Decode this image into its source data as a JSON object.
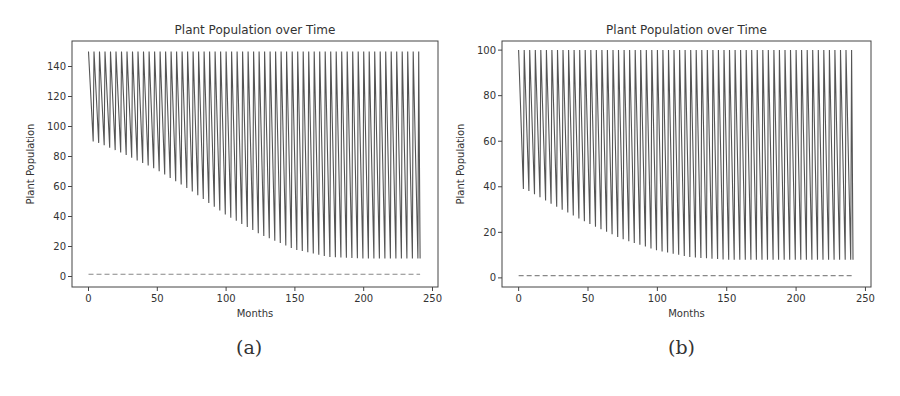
{
  "figure": {
    "captions": [
      "(a)",
      "(b)"
    ]
  },
  "chart_data": [
    {
      "type": "line",
      "panel_label": "(a)",
      "title": "Plant Population over Time",
      "xlabel": "Months",
      "ylabel": "Plant Population",
      "xlim": [
        -12,
        254
      ],
      "ylim": [
        -7,
        157
      ],
      "xticks": [
        0,
        50,
        100,
        150,
        200,
        250
      ],
      "yticks": [
        0,
        20,
        40,
        60,
        80,
        100,
        120,
        140
      ],
      "grid": false,
      "legend": null,
      "series": [
        {
          "name": "plant population",
          "style": "solid",
          "color": "#555555",
          "pattern": "sawtooth",
          "period_months": 4,
          "x_range": [
            0,
            241
          ],
          "peak_value": 150,
          "trough_envelope": {
            "x": [
              5,
              25,
              50,
              75,
              100,
              125,
              150,
              175,
              200,
              241
            ],
            "y": [
              90,
              82,
              71,
              57,
              41,
              28,
              18,
              13,
              12,
              12
            ]
          }
        },
        {
          "name": "threshold",
          "style": "dashed",
          "color": "#888888",
          "x": [
            0,
            241
          ],
          "y": [
            1.5,
            1.5
          ]
        }
      ]
    },
    {
      "type": "line",
      "panel_label": "(b)",
      "title": "Plant Population over Time",
      "xlabel": "Months",
      "ylabel": "Plant Population",
      "xlim": [
        -12,
        254
      ],
      "ylim": [
        -4,
        104
      ],
      "xticks": [
        0,
        50,
        100,
        150,
        200,
        250
      ],
      "yticks": [
        0,
        20,
        40,
        60,
        80,
        100
      ],
      "grid": false,
      "legend": null,
      "series": [
        {
          "name": "plant population",
          "style": "solid",
          "color": "#555555",
          "pattern": "sawtooth",
          "period_months": 4,
          "x_range": [
            0,
            241
          ],
          "peak_value": 100,
          "trough_envelope": {
            "x": [
              5,
              25,
              50,
              75,
              100,
              125,
              150,
              175,
              200,
              241
            ],
            "y": [
              39,
              32,
              24,
              17,
              12,
              9,
              8,
              8,
              8,
              8
            ]
          }
        },
        {
          "name": "threshold",
          "style": "dashed",
          "color": "#888888",
          "x": [
            0,
            241
          ],
          "y": [
            1,
            1
          ]
        }
      ]
    }
  ]
}
